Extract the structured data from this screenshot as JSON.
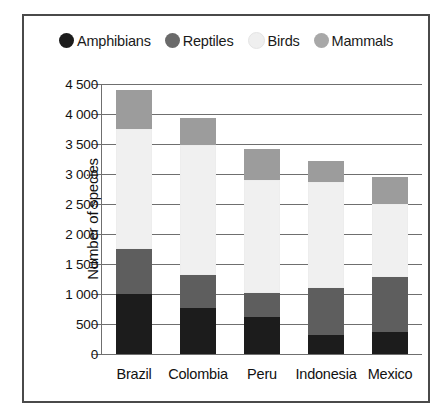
{
  "chart_data": {
    "type": "bar",
    "stacked": true,
    "title": "",
    "xlabel": "",
    "ylabel": "Number of species",
    "ylim": [
      0,
      4500
    ],
    "ytick_step": 500,
    "ytick_labels": [
      "0",
      "500",
      "1 000",
      "1 500",
      "2 000",
      "2 500",
      "3 000",
      "3 500",
      "4 000",
      "4 500"
    ],
    "ytick_values": [
      0,
      500,
      1000,
      1500,
      2000,
      2500,
      3000,
      3500,
      4000,
      4500
    ],
    "grid": true,
    "legend_position": "top-center",
    "categories": [
      "Brazil",
      "Colombia",
      "Peru",
      "Indonesia",
      "Mexico"
    ],
    "series": [
      {
        "name": "Amphibians",
        "color": "#1c1c1c",
        "values": [
          1000,
          770,
          610,
          320,
          360
        ]
      },
      {
        "name": "Reptiles",
        "color": "#5e5e5e",
        "values": [
          750,
          550,
          400,
          780,
          920
        ]
      },
      {
        "name": "Birds",
        "color": "#f0f0f0",
        "values": [
          2000,
          2160,
          1890,
          1760,
          1220
        ]
      },
      {
        "name": "Mammals",
        "color": "#9c9c9c",
        "values": [
          650,
          450,
          520,
          360,
          450
        ]
      }
    ],
    "totals": [
      4400,
      3930,
      3420,
      3220,
      2950
    ]
  },
  "legend": {
    "items": [
      {
        "label": "Amphibians",
        "swatch": "legend-swatch-amphibians",
        "color": "#1c1c1c"
      },
      {
        "label": "Reptiles",
        "swatch": "legend-swatch-reptiles",
        "color": "#6a6a6a"
      },
      {
        "label": "Birds",
        "swatch": "legend-swatch-birds",
        "color": "#efefef"
      },
      {
        "label": "Mammals",
        "swatch": "legend-swatch-mammals",
        "color": "#a8a8a8"
      }
    ]
  },
  "frame": {
    "border_color": "#4a4a4a",
    "background": "#ffffff"
  }
}
